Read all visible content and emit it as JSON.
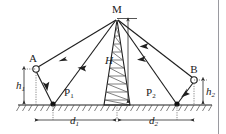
{
  "figure": {
    "type": "optics-reflection-geometry-diagram",
    "caption": "",
    "labels": {
      "apex": "M",
      "source_left": "A",
      "source_right": "B",
      "reflection_point_left": "P",
      "reflection_point_left_sub": "1",
      "reflection_point_right": "P",
      "reflection_point_right_sub": "2",
      "tower_height": "H",
      "height_left": "h",
      "height_left_sub": "1",
      "height_right": "h",
      "height_right_sub": "2",
      "distance_left": "d",
      "distance_left_sub": "1",
      "distance_right": "d",
      "distance_right_sub": "2"
    },
    "colors": {
      "ink": "#1f1f1f",
      "hatch": "#4a4a4a",
      "dim": "#2a2a2a",
      "frame": "#9a9aa0",
      "background": "#ffffff"
    },
    "geometry": {
      "apex": {
        "x": 117,
        "y": 19
      },
      "point_a": {
        "x": 36,
        "y": 69
      },
      "point_b": {
        "x": 194,
        "y": 80
      },
      "point_p1": {
        "x": 53,
        "y": 104
      },
      "point_p2": {
        "x": 177,
        "y": 104
      },
      "ground_y": 105,
      "tower_base_left": 104,
      "tower_base_right": 130,
      "height_axis_x": 122,
      "dim_row_y": 120
    },
    "rays": [
      {
        "name": "ray-M-to-A",
        "from": "M",
        "to": "A",
        "arrow": "toward-M"
      },
      {
        "name": "ray-M-to-P1",
        "from": "M",
        "to": "P1",
        "arrow": "toward-M"
      },
      {
        "name": "ray-A-to-P1",
        "from": "A",
        "to": "P1",
        "arrow": "toward-P1"
      },
      {
        "name": "ray-M-to-B",
        "from": "M",
        "to": "B",
        "arrow": "toward-M"
      },
      {
        "name": "ray-M-to-P2",
        "from": "M",
        "to": "P2",
        "arrow": "toward-M"
      },
      {
        "name": "ray-B-to-P2",
        "from": "B",
        "to": "P2",
        "arrow": "toward-P2"
      }
    ]
  }
}
